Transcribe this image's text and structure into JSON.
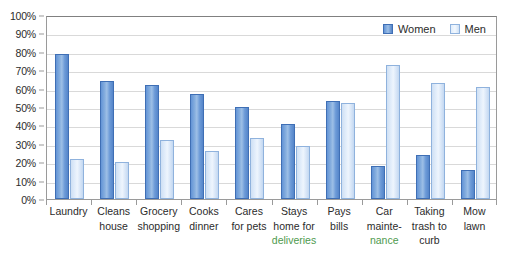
{
  "chart_data": {
    "type": "bar",
    "title": "",
    "xlabel": "",
    "ylabel": "",
    "ylim": [
      0,
      100
    ],
    "ytick_labels": [
      "0%",
      "10%",
      "20%",
      "30%",
      "40%",
      "50%",
      "60%",
      "70%",
      "80%",
      "90%",
      "100%"
    ],
    "ytick_values": [
      0,
      10,
      20,
      30,
      40,
      50,
      60,
      70,
      80,
      90,
      100
    ],
    "grid": true,
    "legend_position": "top-right-inside",
    "categories": [
      "Laundry",
      "Cleans house",
      "Grocery shopping",
      "Cooks dinner",
      "Cares for pets",
      "Stays home for deliveries",
      "Pays bills",
      "Car maintenance",
      "Taking trash to curb",
      "Mow lawn"
    ],
    "category_lines": [
      [
        "Laundry"
      ],
      [
        "Cleans",
        "house"
      ],
      [
        "Grocery",
        "shopping"
      ],
      [
        "Cooks",
        "dinner"
      ],
      [
        "Cares",
        "for pets"
      ],
      [
        "Stays",
        "home for",
        "deliveries"
      ],
      [
        "Pays",
        "bills"
      ],
      [
        "Car",
        "mainte-",
        "nance"
      ],
      [
        "Taking",
        "trash to",
        "curb"
      ],
      [
        "Mow",
        "lawn"
      ]
    ],
    "series": [
      {
        "name": "Women",
        "color": "#6394d6",
        "values": [
          79,
          64,
          62,
          57,
          50,
          41,
          53,
          18,
          24,
          16
        ]
      },
      {
        "name": "Men",
        "color": "#dfecfb",
        "values": [
          22,
          20,
          32,
          26,
          33,
          29,
          52,
          73,
          63,
          61
        ]
      }
    ]
  },
  "legend": {
    "items": [
      {
        "label": "Women",
        "swatch": "women"
      },
      {
        "label": "Men",
        "swatch": "men"
      }
    ]
  },
  "colors": {
    "women_bar": "#6394d6",
    "women_border": "#3f6fb5",
    "men_bar": "#dfecfb",
    "men_border": "#8fb2dd",
    "gridline": "#d9d9d9",
    "axis": "#9a9a9a",
    "text": "#2b2b2b",
    "spellcheck_underline_text": "#4e9a4e"
  },
  "spellcheck_flagged_lines": [
    "deliveries",
    "nance"
  ]
}
